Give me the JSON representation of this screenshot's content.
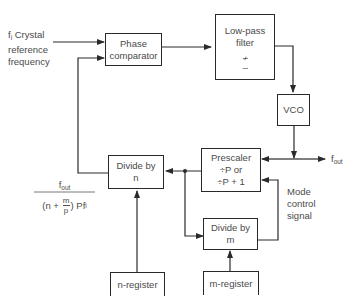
{
  "diagram": {
    "type": "block-diagram",
    "input": {
      "label_prefix": "f",
      "label_sub": "i",
      "label_rest": " Crystal",
      "line2": "reference",
      "line3": "frequency"
    },
    "blocks": {
      "phase_comparator": {
        "line1": "Phase",
        "line2": "comparator"
      },
      "low_pass_filter": {
        "line1": "Low-pass",
        "line2": "filter",
        "symbol1": "≁",
        "symbol2": "∼"
      },
      "vco": {
        "label": "VCO"
      },
      "prescaler": {
        "line1": "Prescaler",
        "line2": "÷P or",
        "line3": "÷P + 1"
      },
      "divide_n": {
        "line1": "Divide by",
        "line2": "n"
      },
      "divide_m": {
        "line1": "Divide by",
        "line2": "m"
      },
      "n_register": {
        "label": "n-register"
      },
      "m_register": {
        "label": "m-register"
      }
    },
    "output": {
      "label_prefix": "f",
      "label_sub": "out"
    },
    "mode_control": {
      "line1": "Mode",
      "line2": "control",
      "line3": "signal"
    },
    "formula": {
      "numerator_prefix": "f",
      "numerator_sub": "out",
      "denominator_open": "(n + ",
      "m_num": "m",
      "m_den": "p",
      "denominator_close": ") Pf",
      "denominator_sub": "i"
    },
    "colors": {
      "line": "#2a2a2a",
      "text": "#4a4a4a",
      "background": "#ffffff"
    }
  }
}
